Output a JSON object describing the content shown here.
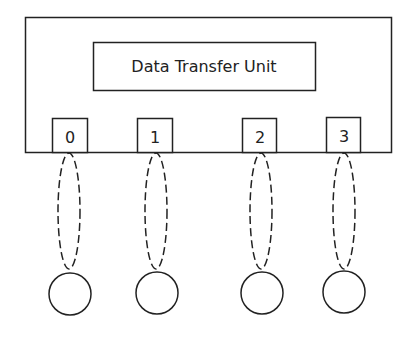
{
  "diagram": {
    "unit_label": "Data Transfer Unit",
    "ports": [
      {
        "label": "0",
        "x": 52,
        "cx": 69
      },
      {
        "label": "1",
        "x": 137,
        "cx": 156
      },
      {
        "label": "2",
        "x": 242,
        "cx": 261
      },
      {
        "label": "3",
        "x": 326,
        "cx": 344
      }
    ],
    "colors": {
      "stroke": "#222222",
      "background": "#ffffff"
    }
  }
}
